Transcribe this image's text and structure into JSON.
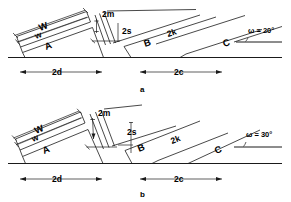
{
  "figure": {
    "panels": [
      {
        "id": "a",
        "caption": "a",
        "angle_label": "ω = 20°",
        "angle_value": 20,
        "block_labels": {
          "outer_width": "W",
          "inner_width": "w",
          "block_a": "A",
          "gap_2m": "2m",
          "gap_2s": "2s",
          "block_b": "B",
          "span_2k": "2k",
          "block_c": "C"
        },
        "baseline_dims": [
          {
            "label": "2d"
          },
          {
            "label": "2c"
          }
        ]
      },
      {
        "id": "b",
        "caption": "b",
        "angle_label": "ω = 30°",
        "angle_value": 30,
        "block_labels": {
          "outer_width": "W",
          "inner_width": "w",
          "block_a": "A",
          "gap_2m": "2m",
          "gap_2s": "2s",
          "block_b": "B",
          "span_2k": "2k",
          "block_c": "C"
        },
        "baseline_dims": [
          {
            "label": "2d"
          },
          {
            "label": "2c"
          }
        ]
      }
    ],
    "colors": {
      "line": "#1a1a1a",
      "text": "#000000",
      "background": "#ffffff"
    }
  }
}
